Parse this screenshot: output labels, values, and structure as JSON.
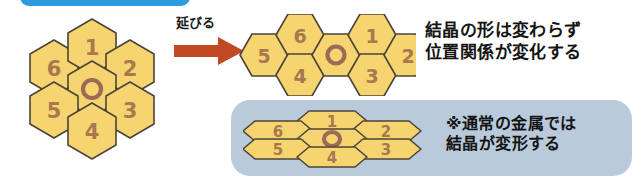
{
  "diagram": {
    "background_color": "#ffffff",
    "top_tab": {
      "color": "#2e9be0"
    },
    "transition": {
      "label": "延びる",
      "arrow_color": "#c14a22",
      "arrow_direction": "right"
    },
    "captions": {
      "main": "結晶の形は変わらず\n位置関係が変化する",
      "note": "※通常の金属では\n結晶が変形する"
    },
    "info_panel": {
      "background_color": "#b9cadb"
    },
    "style": {
      "hex_fill": "#f6d570",
      "hex_stroke": "#4c443a",
      "number_color": "#a9784e",
      "ring_color": "#9c6a55"
    },
    "clusters": [
      {
        "name": "undeformed-crystal",
        "state": "regular",
        "center_symbol": "O",
        "cells": [
          {
            "label": "1",
            "position": "top"
          },
          {
            "label": "2",
            "position": "upper-right"
          },
          {
            "label": "3",
            "position": "lower-right"
          },
          {
            "label": "4",
            "position": "bottom"
          },
          {
            "label": "5",
            "position": "lower-left"
          },
          {
            "label": "6",
            "position": "upper-left"
          }
        ]
      },
      {
        "name": "shifted-crystal",
        "state": "stretched-rearranged",
        "center_symbol": "O",
        "cells": [
          {
            "label": "5",
            "position": "left"
          },
          {
            "label": "6",
            "position": "upper-left"
          },
          {
            "label": "4",
            "position": "lower-left"
          },
          {
            "label": "1",
            "position": "upper-right"
          },
          {
            "label": "3",
            "position": "lower-right"
          },
          {
            "label": "2",
            "position": "right"
          }
        ]
      },
      {
        "name": "deformed-crystal",
        "state": "flattened",
        "center_symbol": "O",
        "cells": [
          {
            "label": "6",
            "position": "upper-left"
          },
          {
            "label": "1",
            "position": "top"
          },
          {
            "label": "2",
            "position": "upper-right"
          },
          {
            "label": "5",
            "position": "lower-left"
          },
          {
            "label": "3",
            "position": "lower-right"
          },
          {
            "label": "4",
            "position": "bottom"
          }
        ]
      }
    ]
  }
}
